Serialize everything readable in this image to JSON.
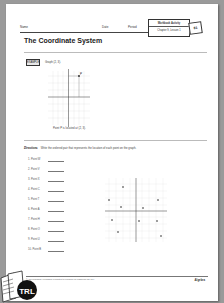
{
  "header": {
    "name_label": "Name",
    "date_label": "Date",
    "period_label": "Period",
    "badge_title": "Workbook Activity",
    "badge_subtitle": "Chapter 9, Lesson 1",
    "page_tag": "81"
  },
  "title": "The Coordinate System",
  "example": {
    "button_label": "EXAMPLE",
    "prompt": "Graph (2, 3).",
    "caption": "Point P is located at (2, 3).",
    "point_label": "P",
    "point": [
      2,
      3
    ]
  },
  "directions": {
    "label": "Directions",
    "text": "Write the ordered pair that represents the location of each point on the graph."
  },
  "questions": [
    {
      "num": "1.",
      "label": "Point W"
    },
    {
      "num": "2.",
      "label": "Point V"
    },
    {
      "num": "3.",
      "label": "Point X"
    },
    {
      "num": "4.",
      "label": "Point C"
    },
    {
      "num": "5.",
      "label": "Point T"
    },
    {
      "num": "6.",
      "label": "Point A"
    },
    {
      "num": "7.",
      "label": "Point H"
    },
    {
      "num": "8.",
      "label": "Point O"
    },
    {
      "num": "9.",
      "label": "Point U"
    },
    {
      "num": "10.",
      "label": "Point B"
    }
  ],
  "footer": {
    "copyright": "©AGS Publishing. Permission is granted to reproduce for classroom use only.",
    "brand": "Algebra"
  },
  "corner_logo": "TRL",
  "colors": {
    "background": "#9a9a9a",
    "page": "#ffffff",
    "rule": "#bbbbbb",
    "logo": "#111111"
  }
}
